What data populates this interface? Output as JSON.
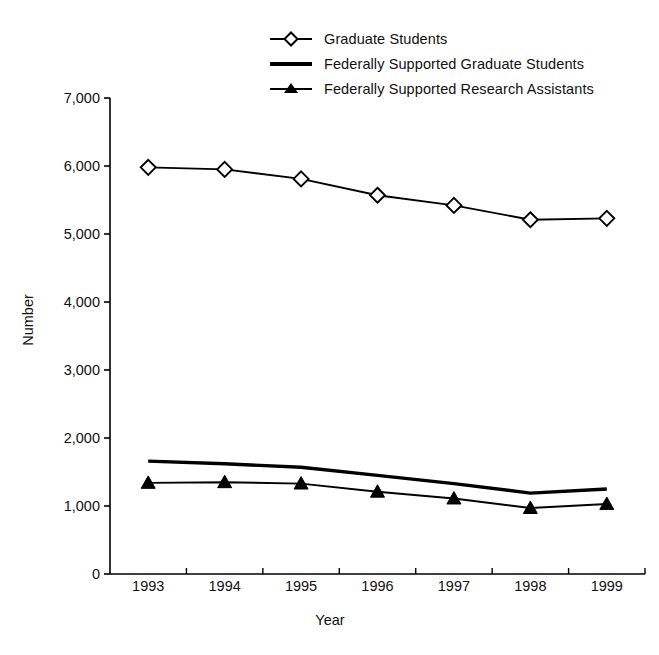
{
  "chart_data": {
    "type": "line",
    "title": "",
    "subtitle": "",
    "xlabel": "Year",
    "ylabel": "Number",
    "categories": [
      "1993",
      "1994",
      "1995",
      "1996",
      "1997",
      "1998",
      "1999"
    ],
    "x": [
      1993,
      1994,
      1995,
      1996,
      1997,
      1998,
      1999
    ],
    "xlim": [
      1992.5,
      1999.5
    ],
    "ylim": [
      0,
      7000
    ],
    "yticks": [
      0,
      1000,
      2000,
      3000,
      4000,
      5000,
      6000,
      7000
    ],
    "ytick_labels": [
      "0",
      "1,000",
      "2,000",
      "3,000",
      "4,000",
      "5,000",
      "6,000",
      "7,000"
    ],
    "grid": false,
    "legend_position": "top-center",
    "series": [
      {
        "name": "Graduate Students",
        "marker": "diamond-open",
        "values": [
          5980,
          5950,
          5810,
          5570,
          5420,
          5210,
          5230
        ]
      },
      {
        "name": "Federally Supported Graduate Students",
        "marker": "none",
        "values": [
          1660,
          1620,
          1570,
          1450,
          1330,
          1190,
          1250
        ]
      },
      {
        "name": "Federally Supported Research Assistants",
        "marker": "triangle-filled",
        "values": [
          1340,
          1350,
          1330,
          1210,
          1110,
          970,
          1030
        ]
      }
    ]
  },
  "legend": {
    "items": [
      {
        "label": "Graduate Students",
        "key": "diamond-open-line-icon"
      },
      {
        "label": "Federally Supported Graduate Students",
        "key": "plain-line-icon"
      },
      {
        "label": "Federally Supported Research Assistants",
        "key": "triangle-filled-line-icon"
      }
    ]
  },
  "colors": {
    "line": "#000000",
    "text": "#111111",
    "background": "#ffffff"
  }
}
